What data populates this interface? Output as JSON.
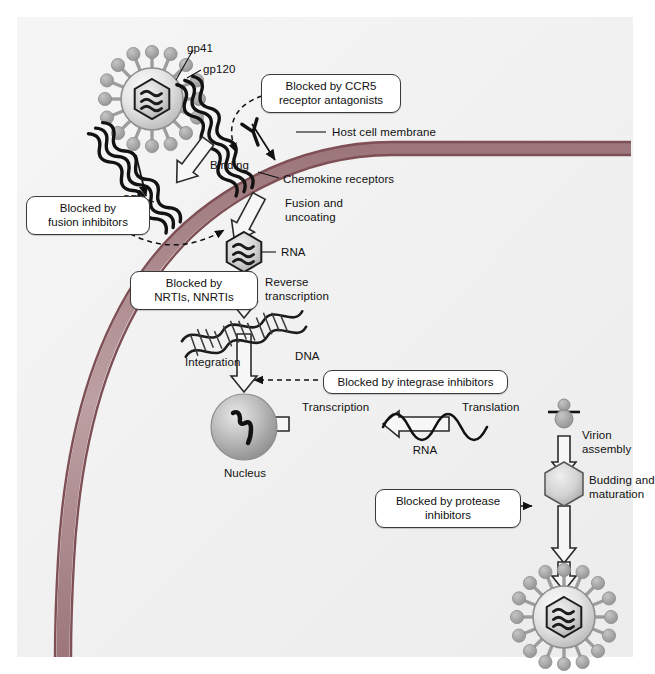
{
  "figure": {
    "panel_background": "#eeeeee",
    "membrane_color": "#8a5a5f",
    "membrane_fill": "#b39497",
    "virion_spike_color": "#9d9d9d",
    "arrow_outline_color": "#2b2b2b"
  },
  "labels": {
    "gp41": "gp41",
    "gp120": "gp120",
    "host_cell_membrane": "Host cell membrane",
    "chemokine_receptors": "Chemokine receptors",
    "cd4": "CD4",
    "binding": "Binding",
    "fusion_and_uncoating": "Fusion and\nuncoating",
    "rna_capsid": "RNA",
    "reverse_transcription": "Reverse\ntranscription",
    "dna": "DNA",
    "integration": "Integration",
    "nucleus": "Nucleus",
    "transcription": "Transcription",
    "rna_transcript": "RNA",
    "translation": "Translation",
    "virion_assembly": "Virion\nassembly",
    "budding_and_maturation": "Budding and\nmaturation"
  },
  "callouts": {
    "ccr5": "Blocked by CCR5\nreceptor antagonists",
    "fusion": "Blocked by\nfusion inhibitors",
    "rt": "Blocked by\nNRTIs, NNRTIs",
    "integrase": "Blocked by integrase inhibitors",
    "protease": "Blocked by protease\ninhibitors"
  },
  "icons": {
    "virion_top": "hiv-virion-icon",
    "virion_bottom": "hiv-virion-icon",
    "capsid": "viral-capsid-hexagon-icon",
    "dna_helix": "dna-double-helix-icon",
    "nucleus": "nucleus-sphere-icon",
    "ribosome": "ribosome-icon",
    "rna_wave": "rna-strand-icon",
    "cd4_receptor": "cd4-receptor-icon",
    "chemokine_receptor": "chemokine-receptor-coil-icon",
    "immature_virion": "immature-virion-hexagon-icon"
  }
}
